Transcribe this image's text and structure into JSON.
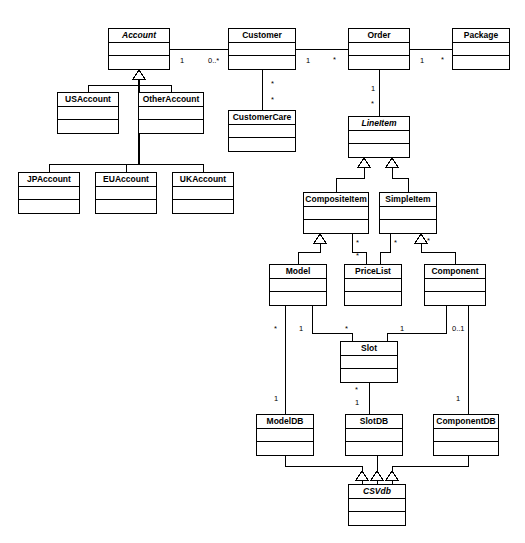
{
  "diagram": {
    "type": "uml-class-diagram",
    "background": "#ffffff",
    "line_color": "#000000",
    "box_fill": "#ffffff"
  },
  "classes": [
    {
      "id": "account",
      "name": "Account",
      "abstract": true,
      "x": 108,
      "y": 28,
      "w": 62,
      "h": 42
    },
    {
      "id": "customer",
      "name": "Customer",
      "abstract": false,
      "x": 228,
      "y": 28,
      "w": 68,
      "h": 42
    },
    {
      "id": "order",
      "name": "Order",
      "abstract": false,
      "x": 348,
      "y": 28,
      "w": 62,
      "h": 42
    },
    {
      "id": "package",
      "name": "Package",
      "abstract": false,
      "x": 452,
      "y": 28,
      "w": 58,
      "h": 42
    },
    {
      "id": "usaccount",
      "name": "USAccount",
      "abstract": false,
      "x": 57,
      "y": 92,
      "w": 62,
      "h": 42
    },
    {
      "id": "otheraccount",
      "name": "OtherAccount",
      "abstract": false,
      "x": 138,
      "y": 92,
      "w": 66,
      "h": 42
    },
    {
      "id": "customercare",
      "name": "CustomerCare",
      "abstract": false,
      "x": 228,
      "y": 110,
      "w": 68,
      "h": 42
    },
    {
      "id": "lineitem",
      "name": "LineItem",
      "abstract": true,
      "x": 348,
      "y": 116,
      "w": 62,
      "h": 42
    },
    {
      "id": "jpaccount",
      "name": "JPAccount",
      "abstract": false,
      "x": 18,
      "y": 172,
      "w": 62,
      "h": 42
    },
    {
      "id": "euaccount",
      "name": "EUAccount",
      "abstract": false,
      "x": 95,
      "y": 172,
      "w": 62,
      "h": 42
    },
    {
      "id": "ukaccount",
      "name": "UKAccount",
      "abstract": false,
      "x": 172,
      "y": 172,
      "w": 62,
      "h": 42
    },
    {
      "id": "compositeitem",
      "name": "CompositeItem",
      "abstract": false,
      "x": 303,
      "y": 192,
      "w": 66,
      "h": 42
    },
    {
      "id": "simpleitem",
      "name": "SimpleItem",
      "abstract": false,
      "x": 379,
      "y": 192,
      "w": 58,
      "h": 42
    },
    {
      "id": "model",
      "name": "Model",
      "abstract": false,
      "x": 269,
      "y": 264,
      "w": 58,
      "h": 42
    },
    {
      "id": "pricelist",
      "name": "PriceList",
      "abstract": false,
      "x": 344,
      "y": 264,
      "w": 58,
      "h": 42
    },
    {
      "id": "component",
      "name": "Component",
      "abstract": false,
      "x": 424,
      "y": 264,
      "w": 62,
      "h": 42
    },
    {
      "id": "slot",
      "name": "Slot",
      "abstract": false,
      "x": 340,
      "y": 341,
      "w": 58,
      "h": 42
    },
    {
      "id": "modeldb",
      "name": "ModelDB",
      "abstract": false,
      "x": 256,
      "y": 414,
      "w": 58,
      "h": 42
    },
    {
      "id": "slotdb",
      "name": "SlotDB",
      "abstract": false,
      "x": 345,
      "y": 414,
      "w": 58,
      "h": 42
    },
    {
      "id": "componentdb",
      "name": "ComponentDB",
      "abstract": false,
      "x": 433,
      "y": 414,
      "w": 66,
      "h": 42
    },
    {
      "id": "csvdb",
      "name": "CSVdb",
      "abstract": true,
      "x": 348,
      "y": 484,
      "w": 58,
      "h": 42
    }
  ],
  "multiplicities": [
    {
      "id": "m-account-1",
      "label": "1",
      "x": 180,
      "y": 57
    },
    {
      "id": "m-customer-0n",
      "label": "0..*",
      "x": 208,
      "y": 57
    },
    {
      "id": "m-customer-1",
      "label": "1",
      "x": 306,
      "y": 57
    },
    {
      "id": "m-order-star",
      "label": "*",
      "x": 333,
      "y": 56
    },
    {
      "id": "m-order-1",
      "label": "1",
      "x": 420,
      "y": 57
    },
    {
      "id": "m-package-star",
      "label": "*",
      "x": 441,
      "y": 56
    },
    {
      "id": "m-cust-care-a",
      "label": "*",
      "x": 271,
      "y": 80
    },
    {
      "id": "m-cust-care-b",
      "label": "*",
      "x": 271,
      "y": 96
    },
    {
      "id": "m-order-line-1",
      "label": "1",
      "x": 371,
      "y": 85
    },
    {
      "id": "m-order-line-star",
      "label": "*",
      "x": 371,
      "y": 100
    },
    {
      "id": "m-comp-pl-a",
      "label": "*",
      "x": 356,
      "y": 239
    },
    {
      "id": "m-comp-pl-b",
      "label": "*",
      "x": 356,
      "y": 252
    },
    {
      "id": "m-simple-pl-a",
      "label": "*",
      "x": 394,
      "y": 239
    },
    {
      "id": "m-simple-pl-b",
      "label": "*",
      "x": 427,
      "y": 237
    },
    {
      "id": "m-model-star",
      "label": "*",
      "x": 274,
      "y": 325
    },
    {
      "id": "m-model-1",
      "label": "1",
      "x": 299,
      "y": 325
    },
    {
      "id": "m-slot-left-star",
      "label": "*",
      "x": 345,
      "y": 325
    },
    {
      "id": "m-slot-right-1",
      "label": "1",
      "x": 400,
      "y": 325
    },
    {
      "id": "m-component-0or1",
      "label": "0..1",
      "x": 452,
      "y": 325
    },
    {
      "id": "m-modeldb-1",
      "label": "1",
      "x": 274,
      "y": 395
    },
    {
      "id": "m-slotdb-star",
      "label": "*",
      "x": 355,
      "y": 386
    },
    {
      "id": "m-slotdb-1",
      "label": "1",
      "x": 355,
      "y": 399
    },
    {
      "id": "m-componentdb-1",
      "label": "1",
      "x": 456,
      "y": 395
    }
  ],
  "associations": [
    {
      "id": "assoc-account-customer",
      "from": "Account",
      "to": "Customer",
      "from_mult": "1",
      "to_mult": "0..*"
    },
    {
      "id": "assoc-customer-order",
      "from": "Customer",
      "to": "Order",
      "from_mult": "1",
      "to_mult": "*"
    },
    {
      "id": "assoc-order-package",
      "from": "Order",
      "to": "Package",
      "from_mult": "1",
      "to_mult": "*"
    },
    {
      "id": "assoc-customer-care",
      "from": "Customer",
      "to": "CustomerCare",
      "from_mult": "*",
      "to_mult": "*"
    },
    {
      "id": "assoc-order-lineitem",
      "from": "Order",
      "to": "LineItem",
      "from_mult": "1",
      "to_mult": "*"
    },
    {
      "id": "assoc-composite-pricelist",
      "from": "CompositeItem",
      "to": "PriceList",
      "from_mult": "*",
      "to_mult": "*"
    },
    {
      "id": "assoc-simple-pricelist",
      "from": "SimpleItem",
      "to": "PriceList",
      "from_mult": "*",
      "to_mult": "*"
    },
    {
      "id": "assoc-model-slot",
      "from": "Model",
      "to": "Slot",
      "from_mult": "1",
      "to_mult": "*"
    },
    {
      "id": "assoc-component-slot",
      "from": "Component",
      "to": "Slot",
      "from_mult": "0..1",
      "to_mult": "1"
    },
    {
      "id": "assoc-model-modeldb",
      "from": "Model",
      "to": "ModelDB",
      "from_mult": "*",
      "to_mult": "1"
    },
    {
      "id": "assoc-slot-slotdb",
      "from": "Slot",
      "to": "SlotDB",
      "from_mult": "*",
      "to_mult": "1"
    },
    {
      "id": "assoc-component-componentdb",
      "from": "Component",
      "to": "ComponentDB",
      "from_mult": "*",
      "to_mult": "1"
    }
  ],
  "generalizations": [
    {
      "id": "gen-usaccount",
      "child": "USAccount",
      "parent": "Account"
    },
    {
      "id": "gen-otheraccount",
      "child": "OtherAccount",
      "parent": "Account"
    },
    {
      "id": "gen-jpaccount",
      "child": "JPAccount",
      "parent": "Account"
    },
    {
      "id": "gen-euaccount",
      "child": "EUAccount",
      "parent": "Account"
    },
    {
      "id": "gen-ukaccount",
      "child": "UKAccount",
      "parent": "Account"
    },
    {
      "id": "gen-compositeitem",
      "child": "CompositeItem",
      "parent": "LineItem"
    },
    {
      "id": "gen-simpleitem",
      "child": "SimpleItem",
      "parent": "LineItem"
    },
    {
      "id": "gen-model",
      "child": "Model",
      "parent": "CompositeItem"
    },
    {
      "id": "gen-pricelist",
      "child": "PriceList",
      "parent": "SimpleItem"
    },
    {
      "id": "gen-component",
      "child": "Component",
      "parent": "SimpleItem"
    },
    {
      "id": "gen-modeldb",
      "child": "ModelDB",
      "parent": "CSVdb"
    },
    {
      "id": "gen-slotdb",
      "child": "SlotDB",
      "parent": "CSVdb"
    },
    {
      "id": "gen-componentdb",
      "child": "ComponentDB",
      "parent": "CSVdb"
    }
  ]
}
